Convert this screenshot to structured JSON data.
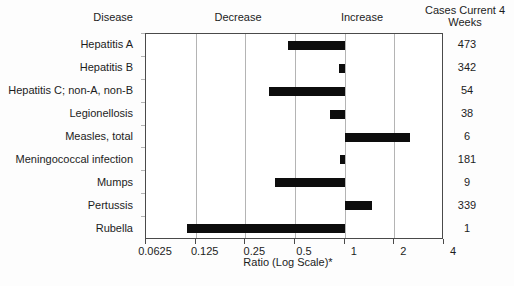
{
  "header": {
    "disease": "Disease",
    "decrease": "Decrease",
    "increase": "Increase",
    "cases_line1": "Cases Current 4",
    "cases_line2": "Weeks"
  },
  "axis": {
    "label": "Ratio (Log Scale)*",
    "tick_labels": [
      "0.0625",
      "0.125",
      "0.25",
      "0.5",
      "1",
      "2",
      "4"
    ]
  },
  "chart_data": {
    "type": "bar",
    "orientation": "horizontal",
    "title": "",
    "xlabel": "Ratio (Log Scale)*",
    "x_scale": "log2",
    "xlim": [
      0.0625,
      4
    ],
    "x_ticks": [
      0.0625,
      0.125,
      0.25,
      0.5,
      1,
      2,
      4
    ],
    "baseline": 1,
    "grid": true,
    "legend": "none",
    "categories": [
      "Hepatitis A",
      "Hepatitis B",
      "Hepatitis C; non-A, non-B",
      "Legionellosis",
      "Measles, total",
      "Meningococcal infection",
      "Mumps",
      "Pertussis",
      "Rubella"
    ],
    "series": [
      {
        "name": "Ratio (Log Scale)*",
        "values": [
          0.45,
          0.92,
          0.35,
          0.81,
          2.48,
          0.93,
          0.38,
          1.46,
          0.11
        ]
      },
      {
        "name": "Cases Current 4 Weeks",
        "values": [
          473,
          342,
          54,
          38,
          6,
          181,
          9,
          339,
          1
        ]
      }
    ]
  },
  "colors": {
    "bar": "#0d0d0d",
    "grid": "#b4b4b4",
    "frame": "#4a4a4a",
    "text": "#1c1c1c",
    "background": "#fdfdfd"
  }
}
